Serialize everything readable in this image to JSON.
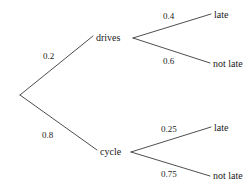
{
  "diagram": {
    "type": "probability-tree",
    "title": "",
    "root": {
      "name": "start-node",
      "label": ""
    },
    "branches": [
      {
        "id": "drives",
        "label": "drives",
        "probability": "0.2",
        "children": [
          {
            "id": "drives-late",
            "label": "late",
            "probability": "0.4"
          },
          {
            "id": "drives-not-late",
            "label": "not late",
            "probability": "0.6"
          }
        ]
      },
      {
        "id": "cycle",
        "label": "cycle",
        "probability": "0.8",
        "children": [
          {
            "id": "cycle-late",
            "label": "late",
            "probability": "0.25"
          },
          {
            "id": "cycle-not-late",
            "label": "not late",
            "probability": "0.75"
          }
        ]
      }
    ],
    "style": {
      "line_color": "#3a3a3a",
      "text_color": "#1a1a1a",
      "background": "#ffffff"
    }
  }
}
